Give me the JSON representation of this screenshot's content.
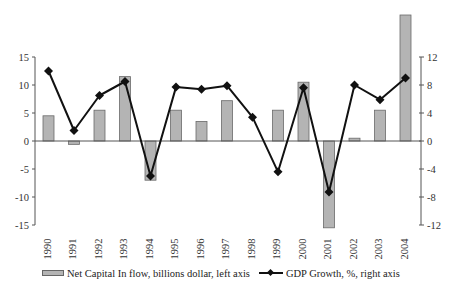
{
  "chart_data": {
    "type": "bar+line",
    "title": "",
    "categories": [
      "1990",
      "1991",
      "1992",
      "1993",
      "1994",
      "1995",
      "1996",
      "1997",
      "1998",
      "1999",
      "2000",
      "2001",
      "2002",
      "2003",
      "2004"
    ],
    "series": [
      {
        "name": "Net Capital In flow, billions dollar, left axis",
        "type": "bar",
        "axis": "left",
        "color": "#b4b4b4",
        "values": [
          4.5,
          -0.6,
          5.5,
          11.5,
          -7.0,
          5.5,
          3.5,
          7.2,
          0,
          5.5,
          10.5,
          -15.5,
          0.5,
          5.5,
          22.5
        ]
      },
      {
        "name": "GDP Growth, %, right axis",
        "type": "line",
        "axis": "right",
        "color": "#111111",
        "marker": "diamond",
        "values": [
          10.0,
          1.5,
          6.5,
          8.5,
          -5.0,
          7.7,
          7.4,
          7.9,
          3.4,
          -4.4,
          7.6,
          -7.3,
          8.0,
          5.9,
          9.0
        ]
      }
    ],
    "left_axis": {
      "label": "",
      "ylim": [
        -15,
        15
      ],
      "ticks": [
        15,
        10,
        5,
        0,
        -5,
        -10,
        -15
      ]
    },
    "right_axis": {
      "label": "",
      "ylim": [
        -12,
        12
      ],
      "ticks": [
        12,
        8,
        4,
        0,
        -4,
        -8,
        -12
      ]
    },
    "xlabel": "",
    "grid": false,
    "legend_position": "bottom"
  },
  "legend": {
    "items": [
      {
        "label": "Net Capital In flow, billions dollar, left axis",
        "kind": "bar"
      },
      {
        "label": "GDP Growth, %, right axis",
        "kind": "line"
      }
    ]
  }
}
